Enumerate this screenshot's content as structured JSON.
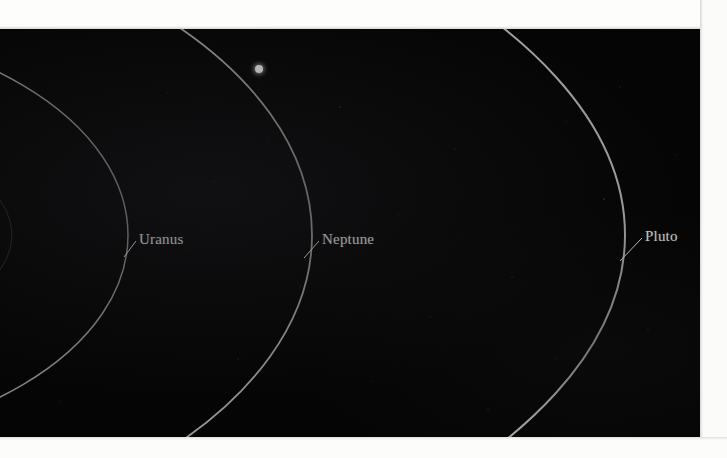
{
  "figure": {
    "kind": "orbit-diagram",
    "background_color": "#050505",
    "page_color": "#fdfdfc",
    "orbit_color": "#b9b9b4",
    "label_color": "#efeeea",
    "plate": {
      "x": 0,
      "y": 29,
      "width": 700,
      "height": 408
    }
  },
  "orbits": [
    {
      "name": "inner-orbit-faint",
      "label": "",
      "center_x": -300,
      "center_y": 206,
      "rx": 312,
      "ry": 128,
      "stroke": "#4a4a47",
      "stroke_width": 1.0,
      "opacity": 0.55
    },
    {
      "name": "uranus-orbit",
      "label": "Uranus",
      "center_x": -232,
      "center_y": 206,
      "rx": 360,
      "ry": 212,
      "stroke": "#9d9d98",
      "stroke_width": 1.5,
      "opacity": 0.95
    },
    {
      "name": "neptune-orbit",
      "label": "Neptune",
      "center_x": -285,
      "center_y": 206,
      "rx": 597,
      "ry": 330,
      "stroke": "#b0b0aa",
      "stroke_width": 1.8,
      "opacity": 0.95
    },
    {
      "name": "pluto-orbit",
      "label": "Pluto",
      "center_x": -362,
      "center_y": 206,
      "rx": 987,
      "ry": 430,
      "stroke": "#bcbcb6",
      "stroke_width": 2.0,
      "opacity": 1.0
    }
  ],
  "labels": [
    {
      "id": "uranus",
      "text": "Uranus",
      "x": 139,
      "y": 203,
      "leader": {
        "x1": 136,
        "y1": 212,
        "x2": 124,
        "y2": 228
      }
    },
    {
      "id": "neptune",
      "text": "Neptune",
      "x": 322,
      "y": 203,
      "leader": {
        "x1": 319,
        "y1": 212,
        "x2": 304,
        "y2": 229
      }
    },
    {
      "id": "pluto",
      "text": "Pluto",
      "x": 645,
      "y": 200,
      "leader": {
        "x1": 642,
        "y1": 209,
        "x2": 620,
        "y2": 232
      }
    }
  ],
  "markers": [
    {
      "id": "planet-dot",
      "name": "planet-marker",
      "x": 255,
      "y": 36,
      "size": 8,
      "color": "#fbfbf8"
    }
  ],
  "stars": [
    {
      "x": 92,
      "y": 118,
      "r": 0.6,
      "o": 0.3
    },
    {
      "x": 167,
      "y": 64,
      "r": 0.5,
      "o": 0.22
    },
    {
      "x": 214,
      "y": 152,
      "r": 0.6,
      "o": 0.26
    },
    {
      "x": 268,
      "y": 110,
      "r": 0.5,
      "o": 0.2
    },
    {
      "x": 340,
      "y": 78,
      "r": 0.7,
      "o": 0.3
    },
    {
      "x": 398,
      "y": 186,
      "r": 0.5,
      "o": 0.22
    },
    {
      "x": 455,
      "y": 120,
      "r": 0.6,
      "o": 0.26
    },
    {
      "x": 512,
      "y": 248,
      "r": 0.6,
      "o": 0.28
    },
    {
      "x": 566,
      "y": 92,
      "r": 0.5,
      "o": 0.2
    },
    {
      "x": 604,
      "y": 170,
      "r": 0.7,
      "o": 0.32
    },
    {
      "x": 648,
      "y": 300,
      "r": 0.6,
      "o": 0.24
    },
    {
      "x": 676,
      "y": 126,
      "r": 0.5,
      "o": 0.2
    },
    {
      "x": 120,
      "y": 300,
      "r": 0.5,
      "o": 0.18
    },
    {
      "x": 238,
      "y": 330,
      "r": 0.6,
      "o": 0.22
    },
    {
      "x": 372,
      "y": 352,
      "r": 0.5,
      "o": 0.2
    },
    {
      "x": 488,
      "y": 380,
      "r": 0.6,
      "o": 0.24
    },
    {
      "x": 556,
      "y": 330,
      "r": 0.5,
      "o": 0.18
    },
    {
      "x": 300,
      "y": 258,
      "r": 0.5,
      "o": 0.18
    },
    {
      "x": 430,
      "y": 288,
      "r": 0.6,
      "o": 0.22
    },
    {
      "x": 190,
      "y": 220,
      "r": 0.5,
      "o": 0.16
    },
    {
      "x": 620,
      "y": 58,
      "r": 0.6,
      "o": 0.24
    },
    {
      "x": 60,
      "y": 372,
      "r": 0.5,
      "o": 0.18
    },
    {
      "x": 528,
      "y": 150,
      "r": 0.5,
      "o": 0.18
    },
    {
      "x": 360,
      "y": 132,
      "r": 0.5,
      "o": 0.16
    }
  ]
}
